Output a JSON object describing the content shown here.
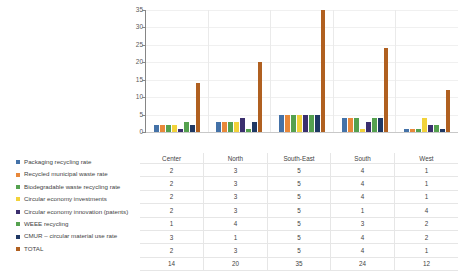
{
  "chart_data": {
    "type": "bar",
    "title": "",
    "xlabel": "",
    "ylabel": "",
    "ylim": [
      0,
      35
    ],
    "yticks": [
      0,
      5,
      10,
      15,
      20,
      25,
      30,
      35
    ],
    "grid": true,
    "legend_position": "left",
    "categories": [
      "Center",
      "North",
      "South-East",
      "South",
      "West"
    ],
    "series": [
      {
        "name": "Packaging recycling rate",
        "color": "#4472a8",
        "values": [
          2,
          3,
          5,
          4,
          1
        ]
      },
      {
        "name": "Recycled municipal waste rate",
        "color": "#e8883a",
        "values": [
          2,
          3,
          5,
          4,
          1
        ]
      },
      {
        "name": "Biodegradable waste recycling rate",
        "color": "#7aa councils",
        "values": [
          2,
          3,
          5,
          4,
          1
        ]
      },
      {
        "name": "Circular economy investments",
        "color": "#f2d23a",
        "values": [
          2,
          3,
          5,
          1,
          4
        ]
      },
      {
        "name": "Circular economy innovation (patents)",
        "color": "#3b2f6e",
        "values": [
          1,
          4,
          5,
          3,
          2
        ]
      },
      {
        "name": "WEEE recycling",
        "color": "#55a14f",
        "values": [
          3,
          1,
          5,
          4,
          2
        ]
      },
      {
        "name": "CMUR – circular material use rate",
        "color": "#1f3864",
        "values": [
          2,
          3,
          5,
          4,
          1
        ]
      },
      {
        "name": "TOTAL",
        "color": "#9c4a12",
        "values": [
          14,
          20,
          35,
          24,
          12
        ]
      }
    ]
  },
  "legend": {
    "items": [
      {
        "label": "Packaging recycling rate",
        "color": "#4472a8"
      },
      {
        "label": "Recycled municipal waste rate",
        "color": "#e8883a"
      },
      {
        "label": "Biodegradable waste recycling rate",
        "color": "#55a14f"
      },
      {
        "label": "Circular economy investments",
        "color": "#f2d23a"
      },
      {
        "label": "Circular economy innovation (patents)",
        "color": "#3b2f6e"
      },
      {
        "label": "WEEE recycling",
        "color": "#55a14f"
      },
      {
        "label": "CMUR – circular material use rate",
        "color": "#1f3864"
      },
      {
        "label": "TOTAL",
        "color": "#b06020"
      }
    ]
  },
  "table": {
    "columns": [
      "Center",
      "North",
      "South-East",
      "South",
      "West"
    ],
    "rows": [
      [
        "2",
        "3",
        "5",
        "4",
        "1"
      ],
      [
        "2",
        "3",
        "5",
        "4",
        "1"
      ],
      [
        "2",
        "3",
        "5",
        "4",
        "1"
      ],
      [
        "2",
        "3",
        "5",
        "1",
        "4"
      ],
      [
        "1",
        "4",
        "5",
        "3",
        "2"
      ],
      [
        "3",
        "1",
        "5",
        "4",
        "2"
      ],
      [
        "2",
        "3",
        "5",
        "4",
        "1"
      ],
      [
        "14",
        "20",
        "35",
        "24",
        "12"
      ]
    ]
  },
  "yaxis": {
    "ticks": [
      "35",
      "30",
      "25",
      "20",
      "15",
      "10",
      "5",
      "0"
    ]
  }
}
